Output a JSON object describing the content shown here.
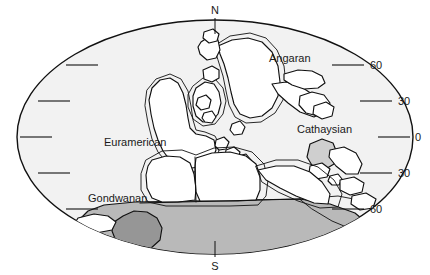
{
  "figure": {
    "kind": "paleogeographic-map",
    "projection": "elliptical",
    "poles": {
      "north_label": "N",
      "south_label": "S"
    },
    "latitude_labels": [
      {
        "text": "60",
        "hemisphere": "north",
        "value": 60
      },
      {
        "text": "30",
        "hemisphere": "north",
        "value": 30
      },
      {
        "text": "0",
        "hemisphere": "equator",
        "value": 0
      },
      {
        "text": "30",
        "hemisphere": "south",
        "value": -30
      },
      {
        "text": "60",
        "hemisphere": "south",
        "value": -60
      }
    ],
    "regions": [
      {
        "id": "euramerican",
        "label": "Euramerican"
      },
      {
        "id": "angaran",
        "label": "Angaran"
      },
      {
        "id": "cathaysian",
        "label": "Cathaysian"
      },
      {
        "id": "gondwanan",
        "label": "Gondwanan"
      }
    ],
    "colors": {
      "ocean": "#f2f2f2",
      "land": "#ffffff",
      "ice_sheet": "#b9b9b9",
      "ice_core": "#969696",
      "outline": "#111111",
      "text": "#1a1a1a",
      "background": "#ffffff"
    }
  }
}
